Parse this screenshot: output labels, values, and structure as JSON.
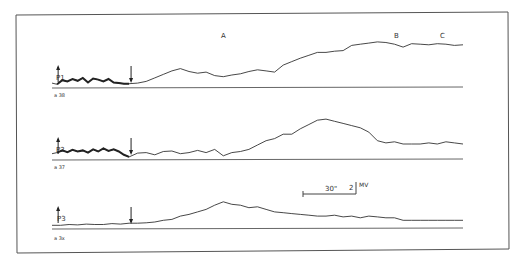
{
  "chart_data": {
    "type": "line",
    "title": "",
    "xlabel": "",
    "ylabel": "",
    "grid": false,
    "section_labels": [
      "A",
      "B",
      "C"
    ],
    "scale_bar": {
      "time_label": "30\"",
      "amplitude_value": "2",
      "amplitude_unit": "MV"
    },
    "x_range_seconds": [
      0,
      240
    ],
    "y_range_mv": [
      0,
      9
    ],
    "series": [
      {
        "name": "P1",
        "tag": "a 38",
        "stimulus_on_s": 3,
        "stimulus_off_s": 45,
        "x": [
          0,
          3,
          6,
          9,
          12,
          15,
          18,
          21,
          24,
          27,
          30,
          33,
          36,
          39,
          42,
          45,
          50,
          55,
          60,
          65,
          70,
          75,
          80,
          85,
          90,
          95,
          100,
          105,
          110,
          115,
          120,
          125,
          130,
          135,
          140,
          145,
          150,
          155,
          160,
          165,
          170,
          175,
          180,
          185,
          190,
          195,
          200,
          205,
          210,
          215,
          220,
          225,
          230,
          235,
          240
        ],
        "values": [
          0.5,
          0.3,
          1.0,
          0.8,
          1.2,
          0.9,
          1.4,
          0.6,
          1.3,
          1.1,
          0.8,
          1.2,
          0.6,
          0.5,
          0.4,
          0.4,
          0.5,
          0.8,
          1.4,
          2.0,
          2.6,
          3.0,
          2.5,
          2.2,
          2.4,
          1.8,
          1.6,
          1.9,
          2.1,
          2.5,
          2.8,
          2.6,
          2.4,
          3.6,
          4.2,
          4.8,
          5.3,
          5.8,
          5.8,
          6.0,
          6.1,
          7.0,
          7.2,
          7.4,
          7.6,
          7.5,
          7.2,
          6.7,
          7.3,
          7.2,
          7.1,
          7.3,
          7.2,
          7.0,
          7.1
        ]
      },
      {
        "name": "P2",
        "tag": "a 37",
        "stimulus_on_s": 3,
        "stimulus_off_s": 45,
        "x": [
          0,
          3,
          6,
          9,
          12,
          15,
          18,
          21,
          24,
          27,
          30,
          33,
          36,
          39,
          42,
          45,
          50,
          55,
          60,
          65,
          70,
          75,
          80,
          85,
          90,
          95,
          100,
          105,
          110,
          115,
          120,
          125,
          130,
          135,
          140,
          145,
          150,
          155,
          160,
          165,
          170,
          175,
          180,
          185,
          190,
          195,
          200,
          205,
          210,
          215,
          220,
          225,
          230,
          235,
          240
        ],
        "values": [
          0.8,
          1.0,
          1.4,
          1.1,
          1.5,
          1.2,
          1.4,
          1.0,
          1.6,
          1.2,
          1.8,
          1.3,
          1.6,
          1.2,
          0.6,
          0.2,
          0.9,
          1.0,
          0.6,
          1.2,
          1.3,
          0.8,
          1.0,
          1.4,
          1.0,
          1.6,
          0.4,
          1.0,
          1.2,
          1.6,
          2.4,
          3.2,
          3.6,
          4.4,
          4.4,
          5.4,
          6.2,
          7.0,
          7.2,
          6.8,
          6.4,
          6.0,
          5.6,
          4.8,
          3.2,
          2.8,
          3.0,
          2.6,
          2.6,
          2.6,
          2.8,
          2.6,
          3.0,
          2.8,
          2.6
        ]
      },
      {
        "name": "P3",
        "tag": "a 3x",
        "stimulus_on_s": 3,
        "stimulus_off_s": 45,
        "x": [
          0,
          5,
          10,
          15,
          20,
          25,
          30,
          35,
          40,
          45,
          50,
          55,
          60,
          65,
          70,
          75,
          80,
          85,
          90,
          95,
          100,
          105,
          110,
          115,
          120,
          125,
          130,
          135,
          140,
          145,
          150,
          155,
          160,
          165,
          170,
          175,
          180,
          185,
          190,
          195,
          200,
          205,
          210,
          215,
          220,
          225,
          230,
          235,
          240
        ],
        "values": [
          0.4,
          0.4,
          0.6,
          0.5,
          0.7,
          0.6,
          0.6,
          0.8,
          0.7,
          0.9,
          0.9,
          1.0,
          1.2,
          1.6,
          1.8,
          2.6,
          3.0,
          3.6,
          4.2,
          5.2,
          6.0,
          5.4,
          5.2,
          4.6,
          4.8,
          4.2,
          3.6,
          3.4,
          3.2,
          3.0,
          2.8,
          2.6,
          2.6,
          2.8,
          2.4,
          2.6,
          2.2,
          2.6,
          2.4,
          2.2,
          2.2,
          1.6,
          1.6,
          1.6,
          1.6,
          1.6,
          1.6,
          1.6,
          1.6
        ]
      }
    ]
  }
}
